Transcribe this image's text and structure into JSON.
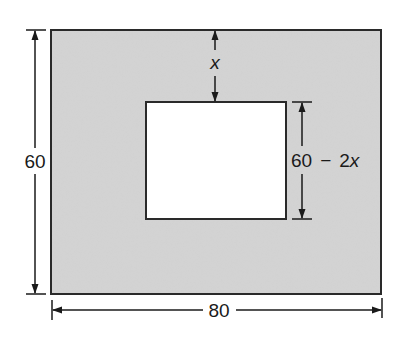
{
  "diagram": {
    "colors": {
      "frame_fill": "#d4d4d4",
      "hole_fill": "#ffffff",
      "stroke": "#2a2a2a"
    },
    "outer_rect": {
      "width_label": "80",
      "height_label": "60"
    },
    "inner_rect": {
      "height_label_num": "60",
      "height_label_op": "−",
      "height_label_term": "2",
      "height_label_var": "x"
    },
    "border_width_label": "x"
  }
}
